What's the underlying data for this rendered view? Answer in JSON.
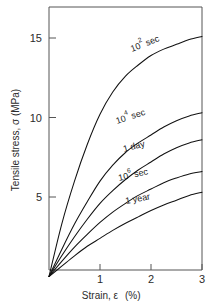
{
  "chart_data": {
    "type": "line",
    "title": "",
    "xlabel": "Strain, ε  (%)",
    "ylabel": "Tensile stress, σ (MPa)",
    "xlim": [
      0,
      3
    ],
    "ylim": [
      0,
      16.5
    ],
    "xticks": [
      1,
      2,
      3
    ],
    "xtick_labels": [
      "1",
      "2",
      "3"
    ],
    "yticks": [
      5,
      10,
      15
    ],
    "ytick_labels": [
      "5",
      "10",
      "15"
    ],
    "grid": false,
    "legend": "inline curve labels",
    "x": [
      0,
      0.25,
      0.5,
      0.75,
      1.0,
      1.25,
      1.5,
      1.75,
      2.0,
      2.25,
      2.5,
      2.75,
      3.0
    ],
    "series": [
      {
        "name": "10^2 sec",
        "label": "10",
        "label_sup": "2",
        "label_tail": " sec",
        "values": [
          0,
          3.3,
          6.0,
          8.3,
          10.2,
          11.6,
          12.6,
          13.3,
          13.9,
          14.3,
          14.6,
          14.9,
          15.1
        ]
      },
      {
        "name": "10^4 sec",
        "label": "10",
        "label_sup": "4",
        "label_tail": " sec",
        "values": [
          0,
          1.7,
          3.3,
          4.7,
          6.0,
          7.0,
          7.8,
          8.4,
          8.9,
          9.4,
          9.8,
          10.1,
          10.3
        ]
      },
      {
        "name": "1 day",
        "label": "1 day",
        "label_sup": "",
        "label_tail": "",
        "values": [
          0,
          1.3,
          2.5,
          3.6,
          4.6,
          5.4,
          6.1,
          6.7,
          7.2,
          7.7,
          8.1,
          8.4,
          8.6
        ]
      },
      {
        "name": "10^6 sec",
        "label": "10",
        "label_sup": "6",
        "label_tail": " sec",
        "values": [
          0,
          0.95,
          1.85,
          2.65,
          3.4,
          4.05,
          4.6,
          5.1,
          5.5,
          5.9,
          6.2,
          6.45,
          6.6
        ]
      },
      {
        "name": "1 year",
        "label": "1 year",
        "label_sup": "",
        "label_tail": "",
        "values": [
          0,
          0.65,
          1.3,
          1.9,
          2.4,
          2.9,
          3.35,
          3.75,
          4.15,
          4.5,
          4.8,
          5.1,
          5.3
        ]
      }
    ],
    "annotations": [
      {
        "text": "10² sec",
        "x": 1.85,
        "y": 14.2,
        "rotation": -22
      },
      {
        "text": "10⁴ sec",
        "x": 1.55,
        "y": 9.6,
        "rotation": -18
      },
      {
        "text": "1 day",
        "x": 1.45,
        "y": 7.6,
        "rotation": -15
      },
      {
        "text": "10⁶ sec",
        "x": 1.6,
        "y": 5.9,
        "rotation": -13
      },
      {
        "text": "1 year",
        "x": 1.7,
        "y": 4.7,
        "rotation": -11
      }
    ]
  },
  "axes": {
    "ylabel": "Tensile stress, σ (MPa)",
    "xlabel_main": "Strain, ε",
    "xlabel_unit": "(%)",
    "ytick_1": "15",
    "ytick_2": "10",
    "ytick_3": "5",
    "xtick_1": "1",
    "xtick_2": "2",
    "xtick_3": "3"
  },
  "curve_labels": {
    "c1_base": "10",
    "c1_sup": "2",
    "c1_tail": "sec",
    "c2_base": "10",
    "c2_sup": "4",
    "c2_tail": "sec",
    "c3_text": "1 day",
    "c4_base": "10",
    "c4_sup": "6",
    "c4_tail": "sec",
    "c5_text": "1 year"
  },
  "colors": {
    "curve": "#111111",
    "frame": "#555555",
    "text": "#2b2b2b",
    "background": "#ffffff"
  }
}
